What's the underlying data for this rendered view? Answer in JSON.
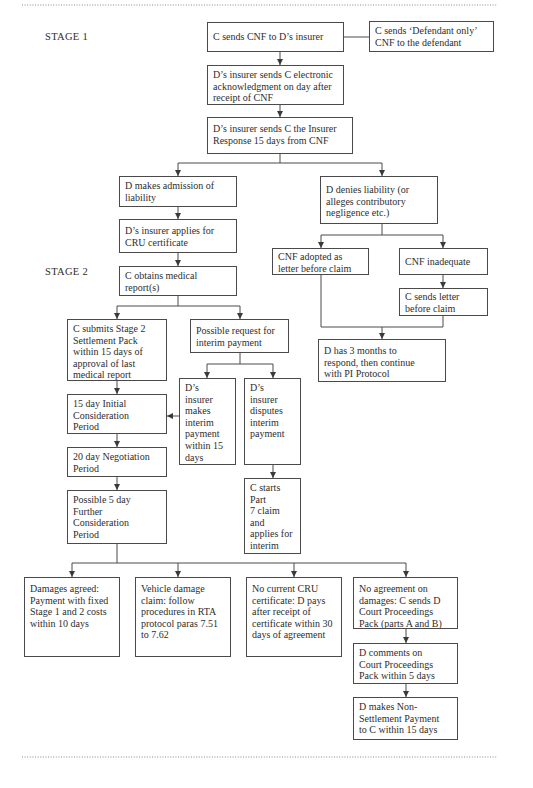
{
  "stages": {
    "stage1": "STAGE 1",
    "stage2": "STAGE 2"
  },
  "boxes": {
    "cnf_to_insurer": "C sends CNF to D’s insurer",
    "defendant_only_cnf": "C sends ‘Defendant only’\nCNF to the defendant",
    "electronic_ack": "D’s insurer sends C electronic\nacknowledgment on day after\nreceipt of CNF",
    "insurer_response": "D’s insurer sends C the Insurer\nResponse 15 days from CNF",
    "admission_of_liability": "D makes admission of\nliability",
    "denies_liability": "D denies liability (or\nalleges contributory\nnegligence etc.)",
    "applies_cru": "D’s insurer applies for\nCRU certificate",
    "medical_reports": "C obtains medical\nreport(s)",
    "cnf_adopted": "CNF adopted as\nletter before claim",
    "cnf_inadequate": "CNF inadequate",
    "letter_before_claim": "C sends letter\nbefore claim",
    "three_months": "D has 3 months to\nrespond, then continue\nwith PI Protocol",
    "stage2_pack": "C submits Stage 2\nSettlement Pack\nwithin 15 days of\napproval of last\nmedical report",
    "interim_request": "Possible request for\ninterim payment",
    "makes_interim": "D’s\ninsurer\nmakes\ninterim\npayment\nwithin 15\ndays",
    "disputes_interim": "D’s\ninsurer\ndisputes\ninterim\npayment",
    "initial_consideration": "15 day Initial\nConsideration\nPeriod",
    "negotiation_period": "20 day Negotiation\nPeriod",
    "further_consideration": "Possible 5 day\nFurther\nConsideration\nPeriod",
    "part7_claim": "C starts Part\n7 claim\nand\napplies for\ninterim\npayment",
    "damages_agreed": "Damages agreed:\nPayment with fixed\nStage 1 and 2 costs\nwithin 10 days",
    "vehicle_damage": "Vehicle damage\nclaim: follow\nprocedures in RTA\nprotocol paras 7.51\nto 7.62",
    "no_cru_certificate": "No current CRU\ncertificate: D pays\nafter receipt of\ncertificate within 30\ndays of agreement",
    "no_agreement": "No agreement on\ndamages: C sends D\nCourt Proceedings\nPack (parts A and B)",
    "comments_on_pack": "D comments on\nCourt Proceedings\nPack within 5 days",
    "non_settlement_payment": "D makes Non-\nSettlement Payment\nto C within 15 days"
  }
}
